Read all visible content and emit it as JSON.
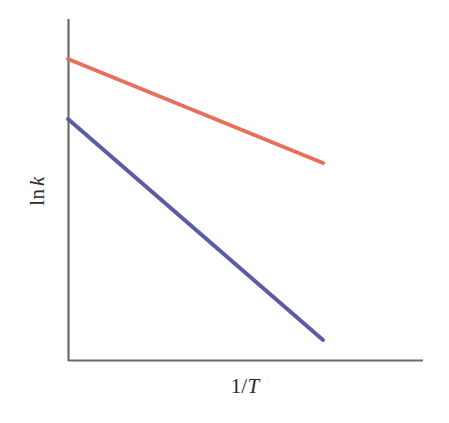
{
  "chart_data": {
    "type": "line",
    "title": "",
    "subtitle": "",
    "xlabel": "1/T",
    "ylabel": "ln k",
    "xlabel_parts": {
      "numerator": "1/",
      "variable": "T"
    },
    "ylabel_parts": {
      "function": "ln",
      "variable": "k"
    },
    "grid": false,
    "legend": null,
    "axis_ticks": [],
    "xlim": [
      0,
      1
    ],
    "ylim": [
      0,
      1
    ],
    "axis_color": "#6b6b6b",
    "background_color": "#ffffff",
    "series": [
      {
        "name": "catalyzed",
        "color": "#e8705a",
        "line_width": 4,
        "x": [
          0.0,
          0.718
        ],
        "y": [
          0.883,
          0.579
        ],
        "pixel_start": {
          "x": 68,
          "y": 59
        },
        "pixel_end": {
          "x": 323,
          "y": 163
        },
        "slope_description": "shallow negative slope"
      },
      {
        "name": "uncatalyzed",
        "color": "#5b5ba6",
        "line_width": 4,
        "x": [
          0.0,
          0.718
        ],
        "y": [
          0.708,
          0.061
        ],
        "pixel_start": {
          "x": 68,
          "y": 119
        },
        "pixel_end": {
          "x": 323,
          "y": 340
        },
        "slope_description": "steep negative slope"
      }
    ]
  },
  "geometry": {
    "y_axis": {
      "x": 68,
      "y_top": 19,
      "y_bottom": 361
    },
    "x_axis": {
      "y": 361,
      "x_left": 68,
      "x_right": 423
    }
  }
}
